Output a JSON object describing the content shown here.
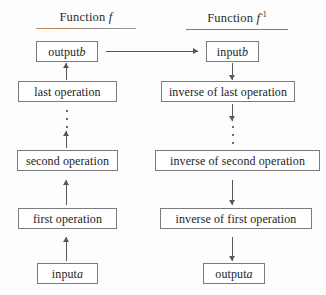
{
  "diagram": {
    "type": "flowchart",
    "columns": [
      {
        "id": "function-f",
        "header_label": "Function",
        "header_symbol": "f",
        "header_superscript": "",
        "direction": "bottom-to-top",
        "underline_color": "#c98a5e"
      },
      {
        "id": "function-f-inverse",
        "header_label": "Function",
        "header_symbol": "f",
        "header_superscript": "-1",
        "direction": "top-to-bottom",
        "underline_color": "#7d7d80"
      }
    ],
    "left_nodes": [
      {
        "id": "output-b",
        "text_plain": "output ",
        "text_italic": "b"
      },
      {
        "id": "last-operation",
        "text_plain": "last operation",
        "text_italic": ""
      },
      {
        "id": "second-operation",
        "text_plain": "second operation",
        "text_italic": ""
      },
      {
        "id": "first-operation",
        "text_plain": "first operation",
        "text_italic": ""
      },
      {
        "id": "input-a",
        "text_plain": "input ",
        "text_italic": "a"
      }
    ],
    "right_nodes": [
      {
        "id": "input-b",
        "text_plain": "input ",
        "text_italic": "b"
      },
      {
        "id": "inverse-of-last-operation",
        "text_plain": "inverse of last operation",
        "text_italic": ""
      },
      {
        "id": "inverse-of-second-operation",
        "text_plain": "inverse of second operation",
        "text_italic": ""
      },
      {
        "id": "inverse-of-first-operation",
        "text_plain": "inverse of first operation",
        "text_italic": ""
      },
      {
        "id": "output-a",
        "text_plain": "output ",
        "text_italic": "a"
      }
    ],
    "ellipsis_dots": 3,
    "connector_color": "#57575a",
    "box_border_color": "#7b7b7e",
    "background_color": "#fdfdfd",
    "text_color": "#242424"
  }
}
